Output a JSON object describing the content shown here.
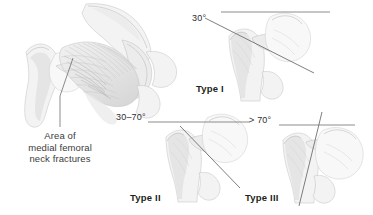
{
  "figure": {
    "background_color": "#ffffff",
    "line_color": "#6f6f6f",
    "bone_fill_color": "#f3f3f3",
    "text_color": "#231f20"
  },
  "overview": {
    "caption_line_1": "Area of",
    "caption_line_2": "medial femoral",
    "caption_line_3": "neck fractures"
  },
  "panels": [
    {
      "id": "type1",
      "type_label": "Type I",
      "angle_label": "30°"
    },
    {
      "id": "type2",
      "type_label": "Type II",
      "angle_label": "30–70°"
    },
    {
      "id": "type3",
      "type_label": "Type III",
      "angle_label": "> 70°"
    }
  ]
}
